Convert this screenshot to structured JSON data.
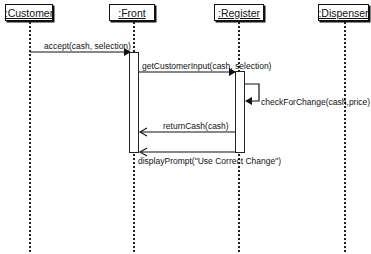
{
  "diagram": {
    "type": "sequence",
    "objects": [
      {
        "id": "customer",
        "label": ":Customer"
      },
      {
        "id": "front",
        "label": ":Front"
      },
      {
        "id": "register",
        "label": ":Register"
      },
      {
        "id": "dispenser",
        "label": ":Dispenser"
      }
    ],
    "messages": [
      {
        "from": "customer",
        "to": "front",
        "label": "accept(cash, selection)",
        "kind": "call"
      },
      {
        "from": "front",
        "to": "register",
        "label": "getCustomerInput(cash, selection)",
        "kind": "call"
      },
      {
        "from": "register",
        "to": "register",
        "label": "checkForChange(cash,price)",
        "kind": "self"
      },
      {
        "from": "register",
        "to": "front",
        "label": "returnCash(cash)",
        "kind": "return"
      },
      {
        "from": "register",
        "to": "front",
        "label": "displayPrompt(\"Use Correct Change\")",
        "kind": "return"
      }
    ],
    "colors": {
      "line": "#111111",
      "background": "#ffffff"
    }
  }
}
